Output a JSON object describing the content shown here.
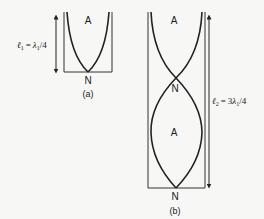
{
  "figure": {
    "panel_a": {
      "caption": "(a)",
      "antinode_label": "A",
      "node_label": "N",
      "length_symbol": "ℓ",
      "length_subscript": "1",
      "length_rhs_symbol": "λ",
      "length_rhs_subscript": "1",
      "length_rhs_suffix": "/4",
      "equals": "="
    },
    "panel_b": {
      "caption": "(b)",
      "antinode_top_label": "A",
      "node_mid_label": "N",
      "antinode_mid_label": "A",
      "node_bottom_label": "N",
      "length_symbol": "ℓ",
      "length_subscript": "2",
      "length_rhs_prefix": "3",
      "length_rhs_symbol": "λ",
      "length_rhs_subscript": "1",
      "length_rhs_suffix": "/4",
      "equals": "="
    },
    "colors": {
      "line": "#222222",
      "background": "#f7f7f5"
    }
  }
}
